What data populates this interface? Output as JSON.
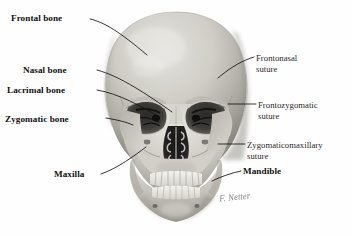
{
  "figure": {
    "style": "grayscale medical illustration",
    "background_color": "#fefefe",
    "line_color": "#141414",
    "signature": "F. Netter"
  },
  "labels_left": [
    {
      "text": "Frontal bone",
      "weight": "bold",
      "x": 11,
      "y": 14
    },
    {
      "text": "Nasal bone",
      "weight": "bold",
      "x": 23,
      "y": 66
    },
    {
      "text": "Lacrimal bone",
      "weight": "bold",
      "x": 7,
      "y": 86
    },
    {
      "text": "Zygomatic bone",
      "weight": "bold",
      "x": 5,
      "y": 115
    },
    {
      "text": "Maxilla",
      "weight": "bold",
      "x": 54,
      "y": 170
    }
  ],
  "labels_right": [
    {
      "line1": "Frontonasal",
      "line2": "suture",
      "weight": "light",
      "x": 256,
      "y": 53
    },
    {
      "line1": "Frontozygomatic",
      "line2": "suture",
      "weight": "light",
      "x": 258,
      "y": 100
    },
    {
      "line1": "Zygomaticomaxillary",
      "line2": "suture",
      "weight": "light",
      "x": 247,
      "y": 140
    },
    {
      "line1": "Mandible",
      "line2": "",
      "weight": "bold",
      "x": 243,
      "y": 167
    }
  ],
  "colors": {
    "bone_light": "#dedcd7",
    "bone_mid": "#bfbcb5",
    "bone_shadow": "#8e8b85",
    "cavity_dark": "#1d1d1d",
    "tooth": "#efeee9"
  }
}
